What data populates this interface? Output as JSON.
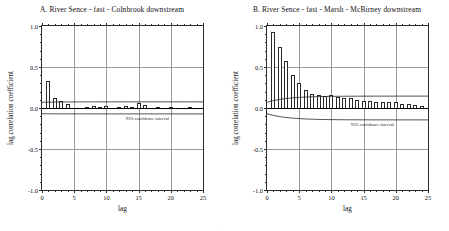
{
  "figure": {
    "background": "#ffffff",
    "bar_edge_color": "#2a2a2a",
    "grid_color": "#9a9a9a",
    "axis_color": "#2b2b2b",
    "footer_mark": "."
  },
  "chart_data": [
    {
      "type": "bar",
      "panel": "A",
      "title": "A. River Sence - fast - Colnbrook downstream",
      "xlabel": "lag",
      "ylabel": "lag correlation coefficient",
      "xlim": [
        0,
        25
      ],
      "ylim": [
        -1.0,
        1.0
      ],
      "grid": true,
      "xticks": [
        0,
        5,
        10,
        15,
        20,
        25
      ],
      "xtick_labels": [
        "0",
        "5",
        "10",
        "15",
        "20",
        "25"
      ],
      "yticks": [
        -1.0,
        -0.5,
        0.0,
        0.5,
        1.0
      ],
      "ytick_labels": [
        "-1.0",
        "-0.5",
        "0.0",
        "0.5",
        "1.0"
      ],
      "categories": [
        1,
        2,
        3,
        4,
        5,
        6,
        7,
        8,
        9,
        10,
        11,
        12,
        13,
        14,
        15,
        16,
        17,
        18,
        19,
        20,
        21,
        22,
        23,
        24
      ],
      "values": [
        0.33,
        0.12,
        0.09,
        0.05,
        0.0,
        0.0,
        0.01,
        0.02,
        0.01,
        0.03,
        0.0,
        0.01,
        0.02,
        0.01,
        0.06,
        0.04,
        0.0,
        0.01,
        0.0,
        0.01,
        0.0,
        0.0,
        0.01,
        0.0
      ],
      "annotation": "95% confidence interval",
      "ci_upper_start": 0.07,
      "ci_upper_end": 0.075,
      "ci_lower_start": -0.07,
      "ci_lower_end": -0.072
    },
    {
      "type": "bar",
      "panel": "B",
      "title": "B. River Sence - fast - Marsh - McBirney downstream",
      "xlabel": "lag",
      "ylabel": "lag correlation coefficient",
      "xlim": [
        0,
        25
      ],
      "ylim": [
        -1.0,
        1.0
      ],
      "grid": true,
      "xticks": [
        0,
        5,
        10,
        15,
        20,
        25
      ],
      "xtick_labels": [
        "0",
        "5",
        "10",
        "15",
        "20",
        "25"
      ],
      "yticks": [
        -1.0,
        -0.5,
        0.0,
        0.5,
        1.0
      ],
      "ytick_labels": [
        "-1.0",
        "-0.5",
        "0.0",
        "0.5",
        "1.0"
      ],
      "categories": [
        1,
        2,
        3,
        4,
        5,
        6,
        7,
        8,
        9,
        10,
        11,
        12,
        13,
        14,
        15,
        16,
        17,
        18,
        19,
        20,
        21,
        22,
        23,
        24
      ],
      "values": [
        0.93,
        0.75,
        0.57,
        0.4,
        0.3,
        0.22,
        0.17,
        0.16,
        0.15,
        0.16,
        0.13,
        0.12,
        0.12,
        0.1,
        0.08,
        0.08,
        0.07,
        0.07,
        0.07,
        0.07,
        0.05,
        0.05,
        0.04,
        0.03
      ],
      "annotation": "95% confidence interval",
      "ci_upper_start": 0.07,
      "ci_upper_end": 0.145,
      "ci_lower_start": -0.07,
      "ci_lower_end": -0.145
    }
  ]
}
